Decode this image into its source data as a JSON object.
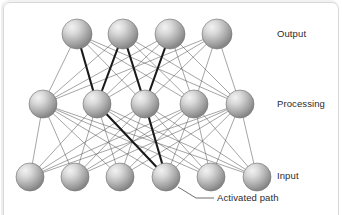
{
  "figure": {
    "background_color": "#ffffff",
    "frame_color": "#d8d8d8",
    "text_color": "#2b2b2b"
  },
  "labels": {
    "output": "Output",
    "processing": "Processing",
    "input": "Input",
    "activated_path": "Activated path"
  },
  "diagram_data": {
    "type": "neural-network",
    "node_style": {
      "fill_light": "#e8e8e8",
      "fill_mid": "#b4b4b4",
      "fill_dark": "#8a8a8a",
      "stroke": "#6e6e6e",
      "highlight": "#f4f4f4"
    },
    "edge_style": {
      "normal_color": "#5a5a5a",
      "normal_width": 0.55,
      "active_color": "#1a1a1a",
      "active_width": 2.1
    },
    "layers": [
      {
        "name": "output",
        "label": "Output",
        "count": 4,
        "radius": 15,
        "y": 34,
        "nodes": [
          {
            "id": "o0",
            "x": 77,
            "y": 34
          },
          {
            "id": "o1",
            "x": 123,
            "y": 34
          },
          {
            "id": "o2",
            "x": 170,
            "y": 34
          },
          {
            "id": "o3",
            "x": 217,
            "y": 34
          }
        ]
      },
      {
        "name": "processing",
        "label": "Processing",
        "count": 5,
        "radius": 14,
        "y": 104,
        "nodes": [
          {
            "id": "p0",
            "x": 43,
            "y": 104
          },
          {
            "id": "p1",
            "x": 97,
            "y": 104
          },
          {
            "id": "p2",
            "x": 145,
            "y": 104
          },
          {
            "id": "p3",
            "x": 194,
            "y": 104
          },
          {
            "id": "p4",
            "x": 240,
            "y": 104
          }
        ]
      },
      {
        "name": "input",
        "label": "Input",
        "count": 6,
        "radius": 14,
        "y": 177,
        "nodes": [
          {
            "id": "i0",
            "x": 30,
            "y": 177
          },
          {
            "id": "i1",
            "x": 75,
            "y": 177
          },
          {
            "id": "i2",
            "x": 120,
            "y": 177
          },
          {
            "id": "i3",
            "x": 166,
            "y": 177
          },
          {
            "id": "i4",
            "x": 211,
            "y": 177
          },
          {
            "id": "i5",
            "x": 257,
            "y": 177
          }
        ]
      }
    ],
    "active_edges": [
      [
        "i3",
        "p1"
      ],
      [
        "i3",
        "p2"
      ],
      [
        "p1",
        "o0"
      ],
      [
        "p1",
        "o1"
      ],
      [
        "p2",
        "o1"
      ],
      [
        "p2",
        "o2"
      ]
    ],
    "callout": {
      "text": "Activated path",
      "leader": [
        [
          178,
          187
        ],
        [
          196,
          198
        ],
        [
          214,
          198
        ]
      ]
    }
  }
}
